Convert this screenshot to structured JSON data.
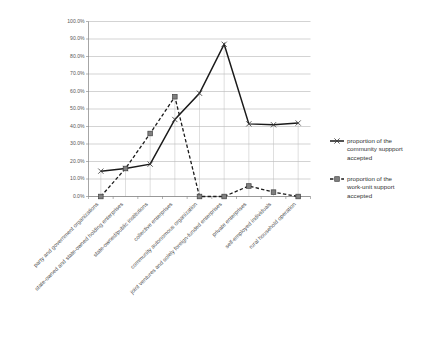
{
  "chart_data": {
    "type": "line",
    "title": "",
    "subtitle": "",
    "xlabel": "",
    "ylabel": "",
    "ylim": [
      0,
      100
    ],
    "grid": true,
    "legend_position": "right",
    "categories": [
      "party and government organizations",
      "state-owned and state-owned holding enterprises",
      "state-owned/public institutions",
      "collective enterprises",
      "community autonomous organization",
      "joint ventures and solely foreign-funded enterprises",
      "private enterprises",
      "self-employed individuals",
      "rural household operation"
    ],
    "ytick_labels": [
      "0.0%",
      "10.0%",
      "20.0%",
      "30.0%",
      "40.0%",
      "50.0%",
      "60.0%",
      "70.0%",
      "80.0%",
      "90.0%",
      "100.0%"
    ],
    "ytick_values": [
      0,
      10,
      20,
      30,
      40,
      50,
      60,
      70,
      80,
      90,
      100
    ],
    "series": [
      {
        "name": "proportion of the community suppport accepted",
        "marker": "x",
        "line_style": "solid",
        "color": "#1a1a1a",
        "values": [
          14.5,
          16.0,
          18.5,
          44.0,
          59.0,
          87.0,
          41.5,
          41.0,
          42.0
        ]
      },
      {
        "name": "proportion of the work-unit support accepted",
        "marker": "square",
        "line_style": "dashed",
        "color": "#1a1a1a",
        "values": [
          0.0,
          16.0,
          36.0,
          57.0,
          0.0,
          0.0,
          6.0,
          2.5,
          0.0
        ]
      }
    ]
  },
  "legend": {
    "items": [
      {
        "lines": [
          "proportion of the",
          "community suppport",
          "accepted"
        ],
        "marker": "x",
        "line_style": "solid"
      },
      {
        "lines": [
          "proportion of the",
          "work-unit support",
          "accepted"
        ],
        "marker": "square",
        "line_style": "dashed"
      }
    ]
  }
}
